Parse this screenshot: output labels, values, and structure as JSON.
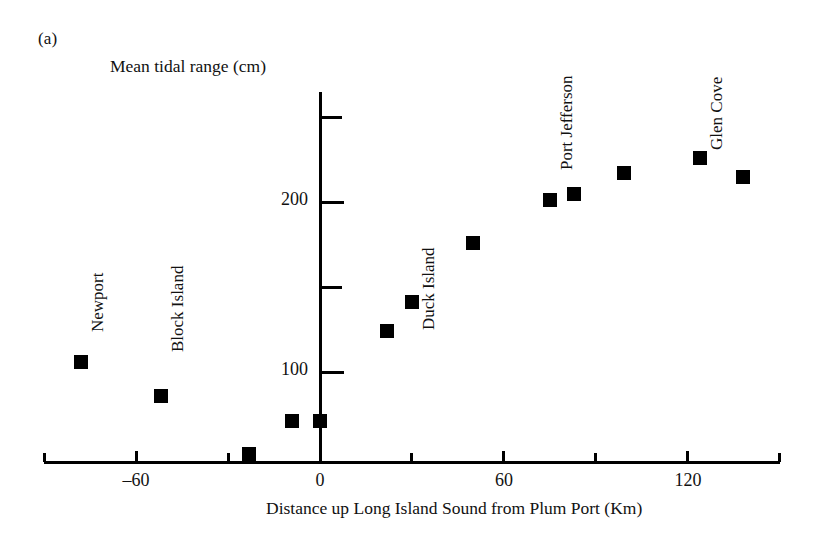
{
  "figure": {
    "panel_label": "(a)",
    "y_axis_title": "Mean tidal range (cm)",
    "x_axis_title": "Distance up Long Island Sound from Plum Port (Km)"
  },
  "chart_data": {
    "type": "scatter",
    "title": "",
    "xlabel": "Distance up Long Island Sound from Plum Port (Km)",
    "ylabel": "Mean tidal range (cm)",
    "xlim": [
      -90,
      150
    ],
    "ylim": [
      0,
      265
    ],
    "grid": false,
    "legend": "none",
    "marker": "filled-square",
    "marker_color": "#000000",
    "x_ticks_major": [
      -60,
      0,
      60,
      120
    ],
    "x_tick_labels": [
      "–60",
      "0",
      "60",
      "120"
    ],
    "x_ticks_minor": [
      -90,
      -30,
      30,
      90,
      150
    ],
    "y_ticks_major": [
      100,
      200
    ],
    "y_tick_labels": [
      "100",
      "200"
    ],
    "y_ticks_minor": [
      150,
      250
    ],
    "points": [
      {
        "x": -78,
        "y": 106,
        "label": "Newport"
      },
      {
        "x": -52,
        "y": 86,
        "label": "Block Island"
      },
      {
        "x": -23,
        "y": 52,
        "label": ""
      },
      {
        "x": -9,
        "y": 71,
        "label": ""
      },
      {
        "x": 0,
        "y": 71,
        "label": ""
      },
      {
        "x": 22,
        "y": 124,
        "label": ""
      },
      {
        "x": 30,
        "y": 141,
        "label": "Duck Island"
      },
      {
        "x": 50,
        "y": 176,
        "label": ""
      },
      {
        "x": 75,
        "y": 201,
        "label": "Port Jefferson"
      },
      {
        "x": 83,
        "y": 205,
        "label": ""
      },
      {
        "x": 99,
        "y": 217,
        "label": ""
      },
      {
        "x": 124,
        "y": 226,
        "label": "Glen Cove"
      },
      {
        "x": 138,
        "y": 215,
        "label": ""
      }
    ],
    "annotations": [
      {
        "text": "Newport",
        "for_x": -78
      },
      {
        "text": "Block Island",
        "for_x": -52
      },
      {
        "text": "Duck Island",
        "for_x": 30
      },
      {
        "text": "Port Jefferson",
        "for_x": 75
      },
      {
        "text": "Glen Cove",
        "for_x": 124
      }
    ]
  }
}
